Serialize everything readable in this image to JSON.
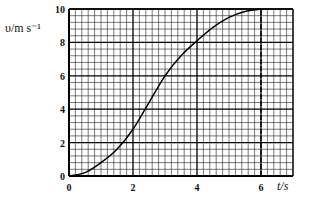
{
  "chart_data": {
    "type": "line",
    "title": "",
    "xlabel": "t/s",
    "ylabel": "υ/m s⁻¹",
    "xlim": [
      0,
      7
    ],
    "ylim": [
      0,
      10
    ],
    "x_ticks": [
      "0",
      "2",
      "4",
      "6"
    ],
    "y_ticks": [
      "0",
      "2",
      "4",
      "6",
      "8",
      "10"
    ],
    "grid": true,
    "grid_minor_step": {
      "x": 0.2,
      "y": 0.4
    },
    "grid_major_step": {
      "x": 2,
      "y": 2
    },
    "legend": null,
    "series": [
      {
        "name": "v(t)",
        "x": [
          0,
          0.5,
          1,
          1.5,
          2,
          2.5,
          3,
          3.5,
          4,
          4.5,
          5,
          5.5,
          6
        ],
        "values": [
          0,
          0.2,
          0.8,
          1.6,
          2.8,
          4.4,
          6.0,
          7.2,
          8.1,
          8.9,
          9.5,
          9.85,
          10
        ]
      }
    ],
    "annotations": [
      {
        "type": "dashed-vertical-line",
        "x": 6,
        "from_y": 0,
        "to_y": 10
      }
    ]
  }
}
